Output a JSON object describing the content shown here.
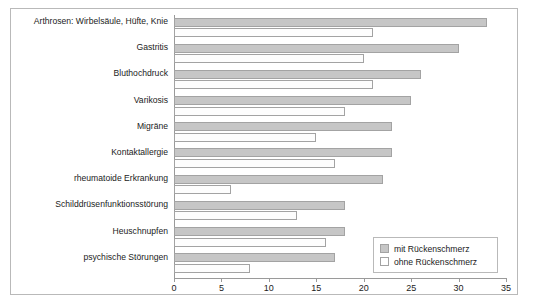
{
  "chart_data": {
    "type": "bar",
    "orientation": "horizontal",
    "title": "",
    "xlabel": "",
    "ylabel": "",
    "xlim": [
      0,
      35
    ],
    "xticks": [
      0,
      5,
      10,
      15,
      20,
      25,
      30,
      35
    ],
    "grid": false,
    "legend_position": "bottom-right",
    "categories": [
      "Arthrosen: Wirbelsäule, Hüfte, Knie",
      "Gastritis",
      "Bluthochdruck",
      "Varikosis",
      "Migräne",
      "Kontaktallergie",
      "rheumatoide Erkrankung",
      "Schilddrüsenfunktionsstörung",
      "Heuschnupfen",
      "psychische Störungen"
    ],
    "series": [
      {
        "name": "mit Rückenschmerz",
        "color": "#c6c6c6",
        "values": [
          33,
          30,
          26,
          25,
          23,
          23,
          22,
          18,
          18,
          17
        ]
      },
      {
        "name": "ohne Rückenschmerz",
        "color": "#ffffff",
        "values": [
          21,
          20,
          21,
          18,
          15,
          17,
          6,
          13,
          16,
          8
        ]
      }
    ]
  },
  "legend": {
    "items": [
      {
        "label": "mit Rückenschmerz",
        "swatch": "legend-swatch-mit"
      },
      {
        "label": "ohne Rückenschmerz",
        "swatch": "legend-swatch-ohne"
      }
    ]
  },
  "axis": {
    "tick_labels": [
      "0",
      "5",
      "10",
      "15",
      "20",
      "25",
      "30",
      "35"
    ]
  },
  "colors": {
    "bar_filled": "#c6c6c6",
    "bar_empty": "#ffffff",
    "bar_border": "#a3a3a3",
    "frame": "#b9b9b9",
    "text": "#1b1b1b"
  }
}
